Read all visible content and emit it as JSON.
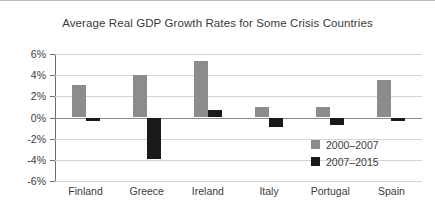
{
  "chart_data": {
    "type": "bar",
    "title": "Average Real GDP Growth Rates for Some Crisis Countries",
    "xlabel": "",
    "ylabel": "",
    "categories": [
      "Finland",
      "Greece",
      "Ireland",
      "Italy",
      "Portugal",
      "Spain"
    ],
    "series": [
      {
        "name": "2000–2007",
        "color": "#8c8c8c",
        "values": [
          3.1,
          4.0,
          5.3,
          1.0,
          1.0,
          3.5
        ]
      },
      {
        "name": "2007–2015",
        "color": "#1a1a1a",
        "values": [
          -0.3,
          -3.9,
          0.7,
          -0.9,
          -0.7,
          -0.3
        ]
      }
    ],
    "ylim": [
      -6,
      6
    ],
    "yticks": [
      6,
      4,
      2,
      0,
      -2,
      -4,
      -6
    ],
    "ytick_labels": [
      "6%",
      "4%",
      "2%",
      "0%",
      "-2%",
      "-4%",
      "-6%"
    ],
    "grid": true,
    "legend_position": "inside-bottom-right",
    "zero_line": true
  }
}
